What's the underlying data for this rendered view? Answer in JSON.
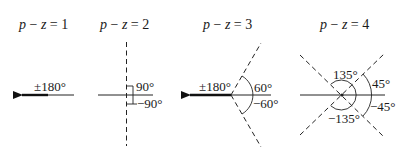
{
  "figure": {
    "panels": [
      {
        "title": {
          "p": "p",
          "minus": " − ",
          "z": "z",
          "eq": " = ",
          "n": "1"
        },
        "labels": {
          "a": "±180°"
        }
      },
      {
        "title": {
          "p": "p",
          "minus": " − ",
          "z": "z",
          "eq": " = ",
          "n": "2"
        },
        "labels": {
          "a": "90°",
          "b": "−90°"
        }
      },
      {
        "title": {
          "p": "p",
          "minus": " − ",
          "z": "z",
          "eq": " = ",
          "n": "3"
        },
        "labels": {
          "a": "±180°",
          "b": "60°",
          "c": "−60°"
        }
      },
      {
        "title": {
          "p": "p",
          "minus": " − ",
          "z": "z",
          "eq": " = ",
          "n": "4"
        },
        "labels": {
          "a": "135°",
          "b": "45°",
          "c": "−135°",
          "d": "−45°"
        }
      }
    ]
  }
}
